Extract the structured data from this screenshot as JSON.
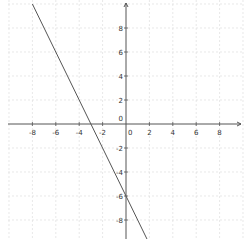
{
  "chart_data": {
    "type": "line",
    "title": "",
    "xlabel": "",
    "ylabel": "",
    "xlim": [
      -10.2,
      10.0
    ],
    "ylim": [
      -9.6,
      10.1
    ],
    "grid": true,
    "grid_style": "dashed",
    "x_ticks": [
      -8,
      -6,
      -4,
      -2,
      0,
      2,
      4,
      6,
      8
    ],
    "y_ticks": [
      -8,
      -6,
      -4,
      -2,
      0,
      2,
      4,
      6,
      8
    ],
    "x_tick_labels": [
      "-8",
      "-6",
      "-4",
      "-2",
      "0",
      "2",
      "4",
      "6",
      "8"
    ],
    "y_tick_labels": [
      "-8",
      "-6",
      "-4",
      "-2",
      "0",
      "2",
      "4",
      "6",
      "8"
    ],
    "series": [
      {
        "name": "y = -2x - 6",
        "slope": -2,
        "intercept": -6,
        "x": [
          -8,
          -3,
          0,
          1.8
        ],
        "y": [
          10,
          0,
          -6,
          -9.6
        ]
      }
    ]
  },
  "colors": {
    "axis": "#555555",
    "grid": "#d8d8d8",
    "line": "#555555",
    "tick_label": "#333333",
    "background": "#ffffff"
  },
  "layout": {
    "origin_px": [
      126,
      124
    ],
    "px_per_unit_x": 11.7,
    "px_per_unit_y": 12.0
  }
}
